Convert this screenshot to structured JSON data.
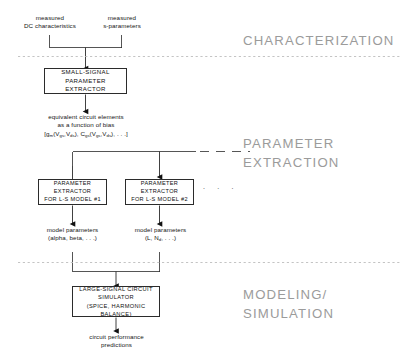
{
  "diagram": {
    "sections": [
      {
        "id": "characterization",
        "label": "CHARACTERIZATION"
      },
      {
        "id": "parameter-extraction",
        "label_line1": "PARAMETER",
        "label_line2": "EXTRACTION"
      },
      {
        "id": "modeling-simulation",
        "label_line1": "MODELING/",
        "label_line2": "SIMULATION"
      }
    ],
    "inputs": [
      {
        "id": "dc",
        "line1": "measured",
        "line2": "DC characteristics"
      },
      {
        "id": "sparam",
        "line1": "measured",
        "line2": "s-parameters"
      }
    ],
    "boxes": [
      {
        "id": "small-signal-parameter-extractor",
        "line1": "SMALL-SIGNAL",
        "line2": "PARAMETER EXTRACTOR"
      },
      {
        "id": "parameter-extractor-model-1",
        "line1": "PARAMETER EXTRACTOR",
        "line2": "FOR L-S MODEL #1"
      },
      {
        "id": "parameter-extractor-model-2",
        "line1": "PARAMETER EXTRACTOR",
        "line2": "FOR L-S MODEL #2"
      },
      {
        "id": "large-signal-circuit-simulator",
        "line1": "LARGE-SIGNAL CIRCUIT",
        "line2": "SIMULATOR",
        "line3": "(SPICE, HARMONIC BALANCE)"
      }
    ],
    "equivalent_circuit": {
      "line1": "equivalent circuit elements",
      "line2": "as a function of bias",
      "formula_prefix": "[g",
      "formula_sub1": "m",
      "formula_mid1": "(V",
      "formula_sub2": "gs",
      "formula_mid2": ",V",
      "formula_sub3": "ds",
      "formula_mid3": "), C",
      "formula_sub4": "gs",
      "formula_mid4": "(V",
      "formula_sub5": "gs",
      "formula_mid5": ",V",
      "formula_sub6": "ds",
      "formula_suffix": "), . . .]"
    },
    "model_params_left": {
      "line1": "model parameters",
      "line2": "(alpha, beta, . . .)"
    },
    "model_params_right": {
      "line1": "model parameters",
      "line2_a": "(L, N",
      "line2_sub": "d",
      "line2_b": ", . . .)"
    },
    "output": {
      "line1": "circuit performance",
      "line2": "predictions"
    },
    "ellipsis": ". . .",
    "colors": {
      "stroke": "#2b2b2b",
      "section_text": "#9b9b9b",
      "divider": "#b9b9b9",
      "background": "#ffffff"
    }
  }
}
